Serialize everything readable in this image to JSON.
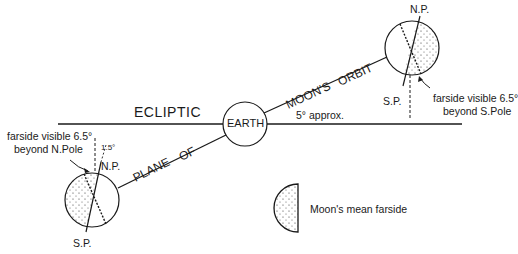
{
  "labels": {
    "ecliptic": "ECLIPTIC",
    "earth": "EARTH",
    "moons": "MOON'S",
    "orbit": "ORBIT",
    "plane": "PLANE",
    "of": "OF",
    "angle": "5° approx.",
    "np_right": "N.P.",
    "sp_right": "S.P.",
    "np_left": "N.P.",
    "sp_left": "S.P.",
    "left_note_line1": "farside visible 6.5°",
    "left_note_line2": "beyond N.Pole",
    "right_note_line1": "farside visible 6.5°",
    "right_note_line2": "beyond S.Pole",
    "small_angle": "1.5°",
    "legend": "Moon's mean farside"
  },
  "colors": {
    "line": "#1a1a1a",
    "background": "#ffffff"
  }
}
